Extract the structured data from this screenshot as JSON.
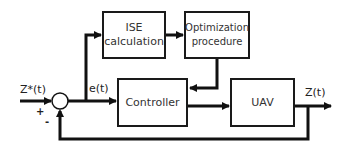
{
  "diagram": {
    "title": "",
    "blocks": [
      {
        "id": "ise",
        "lines": [
          "ISE",
          "calculation"
        ]
      },
      {
        "id": "optimization",
        "lines": [
          "Optimization",
          "procedure"
        ]
      },
      {
        "id": "controller",
        "lines": [
          "Controller"
        ]
      },
      {
        "id": "uav",
        "lines": [
          "UAV"
        ]
      }
    ],
    "signals": {
      "reference": "Z*(t)",
      "error": "e(t)",
      "output": "Z(t)"
    },
    "summing_junction": {
      "plus": "+",
      "minus": "-"
    },
    "colors": {
      "line": "#111111",
      "block_border": "#1a1a1a",
      "text": "#333333",
      "background": "#ffffff"
    }
  }
}
